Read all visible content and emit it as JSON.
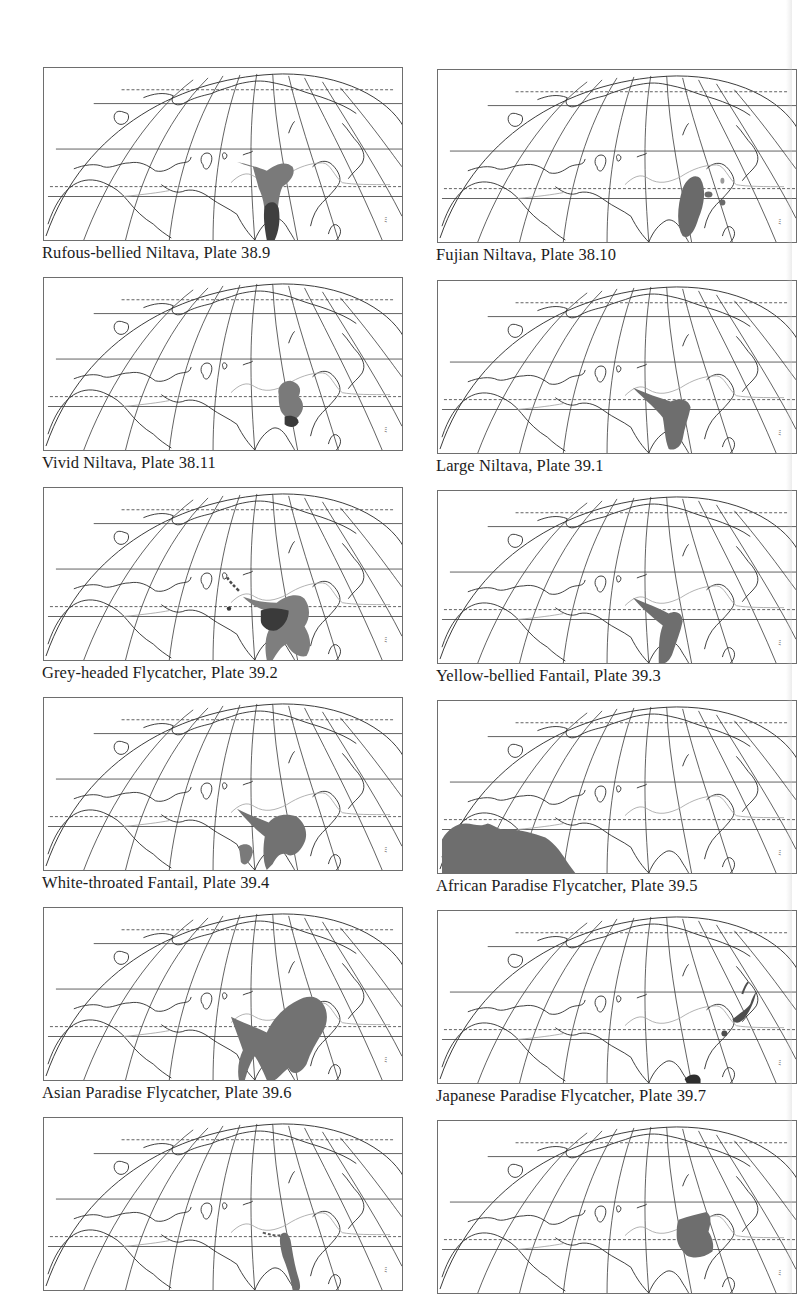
{
  "page": {
    "type": "field-guide distribution map plate",
    "colors": {
      "background": "#ffffff",
      "graticule": "#3a3a3a",
      "coastline": "#2a2a2a",
      "boundary_line": "#a8a8a8",
      "range_breeding": "#7a7a7a",
      "range_resident": "#3f3f3f",
      "caption": "#1c1c1c"
    }
  },
  "maps": [
    {
      "species": "Rufous-bellied Niltava",
      "plate": "38.9",
      "caption": "Rufous-bellied Niltava, Plate 38.9",
      "column": "left",
      "row": 1
    },
    {
      "species": "Fujian Niltava",
      "plate": "38.10",
      "caption": "Fujian Niltava, Plate 38.10",
      "column": "right",
      "row": 1
    },
    {
      "species": "Vivid Niltava",
      "plate": "38.11",
      "caption": "Vivid Niltava, Plate 38.11",
      "column": "left",
      "row": 2
    },
    {
      "species": "Large Niltava",
      "plate": "39.1",
      "caption": "Large Niltava, Plate 39.1",
      "column": "right",
      "row": 2
    },
    {
      "species": "Grey-headed Flycatcher",
      "plate": "39.2",
      "caption": "Grey-headed Flycatcher, Plate 39.2",
      "column": "left",
      "row": 3
    },
    {
      "species": "Yellow-bellied Fantail",
      "plate": "39.3",
      "caption": "Yellow-bellied Fantail, Plate 39.3",
      "column": "right",
      "row": 3
    },
    {
      "species": "White-throated Fantail",
      "plate": "39.4",
      "caption": "White-throated Fantail, Plate 39.4",
      "column": "left",
      "row": 4
    },
    {
      "species": "African Paradise Flycatcher",
      "plate": "39.5",
      "caption": "African Paradise Flycatcher, Plate 39.5",
      "column": "right",
      "row": 4
    },
    {
      "species": "Asian Paradise Flycatcher",
      "plate": "39.6",
      "caption": "Asian Paradise Flycatcher, Plate 39.6",
      "column": "left",
      "row": 5
    },
    {
      "species": "Japanese Paradise Flycatcher",
      "plate": "39.7",
      "caption": "Japanese Paradise Flycatcher, Plate 39.7",
      "column": "right",
      "row": 5
    },
    {
      "species": "",
      "plate": "",
      "caption": "",
      "column": "left",
      "row": 6
    },
    {
      "species": "",
      "plate": "",
      "caption": "",
      "column": "right",
      "row": 6
    }
  ]
}
